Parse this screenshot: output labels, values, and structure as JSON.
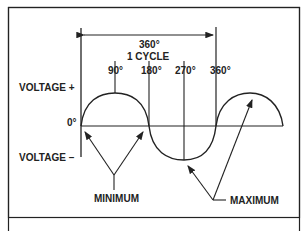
{
  "diagram": {
    "title_degrees": "360°",
    "title_cycle": "1 CYCLE",
    "degree_labels": [
      "90°",
      "180°",
      "270°",
      "360°"
    ],
    "zero_label": "0°",
    "voltage_plus": "VOLTAGE +",
    "voltage_minus": "VOLTAGE –",
    "minimum_label": "MINIMUM",
    "maximum_label": "MAXIMUM",
    "colors": {
      "line": "#222222",
      "background": "#ffffff"
    }
  }
}
